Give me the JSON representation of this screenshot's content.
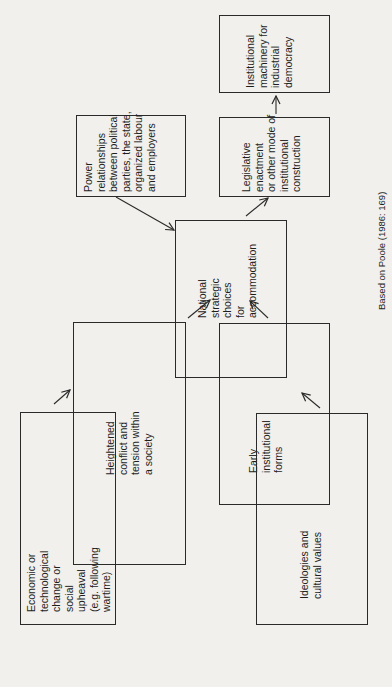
{
  "diagram": {
    "orientation": "rotated 90 degrees counter-clockwise",
    "nodes": [
      {
        "id": "economic",
        "text": "Economic or\ntechnological\nchange or\nsocial\nupheaval\n(e.g. following\nwartime)"
      },
      {
        "id": "heightened",
        "text": "Heightened\nconflict and\ntension within\na society"
      },
      {
        "id": "early",
        "text": "Early\ninstitutional\nforms"
      },
      {
        "id": "ideologies",
        "text": "Ideologies and\ncultural values"
      },
      {
        "id": "national",
        "text": "National\nstrategic\nchoices\nfor\naccommodation"
      },
      {
        "id": "power",
        "text": "Power\nrelationships\nbetween political\nparties, the state,\norganized labour\nand employers"
      },
      {
        "id": "legislative",
        "text": "Legislative\nenactment\nor other mode of\ninstitutional\nconstruction"
      },
      {
        "id": "machinery",
        "text": "Institutional\nmachinery for\nindustrial\ndemocracy"
      }
    ],
    "edges": [
      {
        "from": "economic",
        "to": "heightened"
      },
      {
        "from": "heightened",
        "to": "national"
      },
      {
        "from": "ideologies",
        "to": "early"
      },
      {
        "from": "early",
        "to": "national"
      },
      {
        "from": "power",
        "to": "national"
      },
      {
        "from": "national",
        "to": "legislative"
      },
      {
        "from": "legislative",
        "to": "machinery"
      }
    ],
    "caption": "Based on Poole (1986: 169)"
  }
}
